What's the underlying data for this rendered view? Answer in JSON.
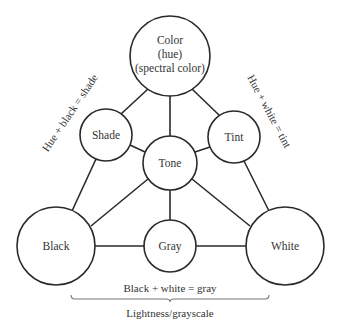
{
  "diagram": {
    "nodes": {
      "color": {
        "lines": [
          "Color",
          "(hue)",
          "(spectral color)"
        ],
        "cx": 170,
        "cy": 56,
        "r": 40
      },
      "shade": {
        "lines": [
          "Shade"
        ],
        "cx": 106,
        "cy": 135,
        "r": 26
      },
      "tint": {
        "lines": [
          "Tint"
        ],
        "cx": 234,
        "cy": 137,
        "r": 26
      },
      "tone": {
        "lines": [
          "Tone"
        ],
        "cx": 170,
        "cy": 163,
        "r": 27
      },
      "black": {
        "lines": [
          "Black"
        ],
        "cx": 56,
        "cy": 246,
        "r": 39
      },
      "gray": {
        "lines": [
          "Gray"
        ],
        "cx": 170,
        "cy": 246,
        "r": 26
      },
      "white": {
        "lines": [
          "White"
        ],
        "cx": 285,
        "cy": 246,
        "r": 39
      }
    },
    "edges": [
      [
        "color",
        "shade"
      ],
      [
        "color",
        "tint"
      ],
      [
        "color",
        "tone"
      ],
      [
        "shade",
        "black"
      ],
      [
        "shade",
        "tone"
      ],
      [
        "tint",
        "white"
      ],
      [
        "tint",
        "tone"
      ],
      [
        "tone",
        "black"
      ],
      [
        "tone",
        "white"
      ],
      [
        "tone",
        "gray"
      ],
      [
        "black",
        "gray"
      ],
      [
        "gray",
        "white"
      ]
    ],
    "annotations": {
      "hue_black": "Hue + black = shade",
      "hue_white": "Hue + white = tint",
      "black_white": "Black + white = gray",
      "lightness": "Lightness/grayscale"
    },
    "colors": {
      "stroke": "#2a2a2a",
      "text": "#333333",
      "background": "#ffffff"
    }
  }
}
